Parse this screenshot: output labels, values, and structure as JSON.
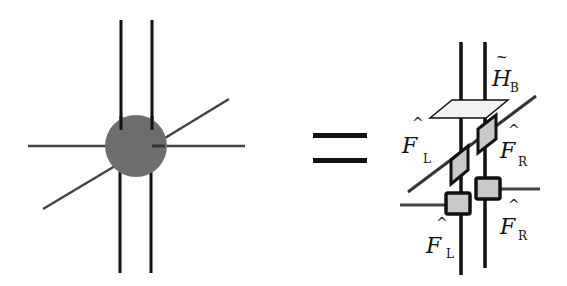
{
  "equation": {
    "operator": "=",
    "left": {
      "node": "gray-circle-tensor",
      "color": "#6e6e6e",
      "legs": 6
    },
    "right": {
      "labels": {
        "hb": {
          "symbol": "H",
          "accent": "~",
          "subscript": "B"
        },
        "fl_top": {
          "symbol": "F",
          "accent": "^",
          "subscript": "L"
        },
        "fr_top": {
          "symbol": "F",
          "accent": "^",
          "subscript": "R"
        },
        "fl_bottom": {
          "symbol": "F",
          "accent": "^",
          "subscript": "L"
        },
        "fr_bottom": {
          "symbol": "F",
          "accent": "^",
          "subscript": "R"
        }
      },
      "box_fill": "#c9c9c9",
      "plane_fill": "#f2f2f2"
    }
  }
}
